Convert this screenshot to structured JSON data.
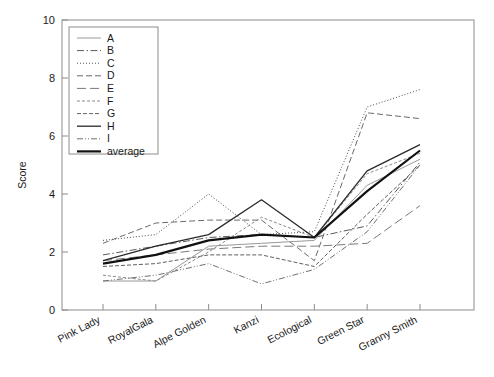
{
  "chart_data": {
    "type": "line",
    "title": "",
    "xlabel": "",
    "ylabel": "Score",
    "ylim": [
      0,
      10
    ],
    "yticks": [
      0,
      2,
      4,
      6,
      8,
      10
    ],
    "grid": false,
    "legend_position": "upper-left",
    "categories": [
      "Pink Lady",
      "RoyalGala",
      "Alpe Golden",
      "Kanzi",
      "Ecological",
      "Green Star",
      "Granny Smith"
    ],
    "series": [
      {
        "name": "A",
        "dash": "solid",
        "width": 1.0,
        "color": "#9a9a9a",
        "values": [
          1.0,
          1.0,
          2.2,
          2.3,
          2.4,
          4.3,
          5.2
        ]
      },
      {
        "name": "B",
        "dash": "dashdot",
        "width": 1.0,
        "color": "#5a5a5a",
        "values": [
          1.9,
          2.2,
          2.5,
          2.6,
          2.5,
          2.9,
          5.1
        ]
      },
      {
        "name": "C",
        "dash": "dotted",
        "width": 1.0,
        "color": "#4a4a4a",
        "values": [
          2.4,
          2.6,
          4.0,
          2.6,
          2.7,
          7.0,
          7.6
        ]
      },
      {
        "name": "D",
        "dash": "dashed",
        "width": 1.0,
        "color": "#6a6a6a",
        "values": [
          2.3,
          3.0,
          3.1,
          3.1,
          1.7,
          6.8,
          6.6
        ]
      },
      {
        "name": "E",
        "dash": "longdash",
        "width": 1.0,
        "color": "#7a7a7a",
        "values": [
          1.7,
          1.9,
          2.1,
          2.2,
          2.2,
          2.3,
          3.6
        ]
      },
      {
        "name": "F",
        "dash": "smalldash",
        "width": 1.0,
        "color": "#8a8a8a",
        "values": [
          1.2,
          1.0,
          2.0,
          3.2,
          2.5,
          4.7,
          5.4
        ]
      },
      {
        "name": "G",
        "dash": "dashdotdot",
        "width": 1.0,
        "color": "#5f5f5f",
        "values": [
          1.5,
          1.6,
          1.9,
          1.9,
          1.5,
          3.3,
          5.0
        ]
      },
      {
        "name": "H",
        "dash": "solid",
        "width": 1.3,
        "color": "#2a2a2a",
        "values": [
          1.7,
          2.2,
          2.6,
          3.8,
          2.5,
          4.8,
          5.7
        ]
      },
      {
        "name": "I",
        "dash": "dashdot2",
        "width": 1.0,
        "color": "#707070",
        "values": [
          1.0,
          1.2,
          1.6,
          0.9,
          1.4,
          2.7,
          5.0
        ]
      },
      {
        "name": "average",
        "dash": "solid",
        "width": 2.2,
        "color": "#111111",
        "values": [
          1.6,
          1.9,
          2.4,
          2.6,
          2.5,
          4.1,
          5.5
        ]
      }
    ]
  },
  "legend": {
    "entries": [
      "A",
      "B",
      "C",
      "D",
      "E",
      "F",
      "G",
      "H",
      "I",
      "average"
    ]
  },
  "axes": {
    "y_title": "Score",
    "y_tick_labels": [
      "0",
      "2",
      "4",
      "6",
      "8",
      "10"
    ],
    "x_tick_labels": [
      "Pink Lady",
      "RoyalGala",
      "Alpe Golden",
      "Kanzi",
      "Ecological",
      "Green Star",
      "Granny Smith"
    ]
  }
}
